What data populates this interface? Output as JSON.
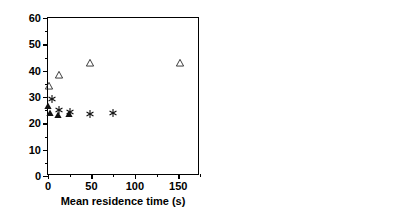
{
  "figure": {
    "ylabel": "CV (based on volume PSD) (%)",
    "width": 410,
    "height": 224,
    "background": "#ffffff",
    "ink_color": "#000000"
  },
  "chart_data": [
    {
      "type": "scatter",
      "panel": "left",
      "title": "",
      "xlabel": "Mean residence time (s)",
      "ylabel": "CV (based on volume PSD) (%)",
      "xlim": [
        0,
        175
      ],
      "ylim": [
        0,
        60
      ],
      "xticks": [
        0,
        50,
        100,
        150
      ],
      "xticklabels": [
        "0",
        "50",
        "100",
        "150"
      ],
      "xminorticks": [
        25,
        75,
        125,
        175
      ],
      "yticks": [
        0,
        10,
        20,
        30,
        40,
        50,
        60
      ],
      "yticklabels": [
        "0",
        "10",
        "20",
        "30",
        "40",
        "50",
        "60"
      ],
      "yminorticks": [
        5,
        15,
        25,
        35,
        45,
        55
      ],
      "grid": false,
      "legend": "none",
      "series": [
        {
          "name": "open-triangle",
          "marker": "open-triangle",
          "points": [
            {
              "x": 1,
              "y": 34.2
            },
            {
              "x": 13,
              "y": 38.4
            },
            {
              "x": 48,
              "y": 43.0
            },
            {
              "x": 152,
              "y": 42.9
            }
          ]
        },
        {
          "name": "asterisk",
          "marker": "asterisk",
          "points": [
            {
              "x": 5,
              "y": 29.4
            },
            {
              "x": 13,
              "y": 25.2
            },
            {
              "x": 25,
              "y": 24.3
            },
            {
              "x": 48,
              "y": 23.6
            },
            {
              "x": 75,
              "y": 24.0
            }
          ]
        },
        {
          "name": "filled-triangle",
          "marker": "filled-triangle",
          "points": [
            {
              "x": 0.5,
              "y": 26.4
            },
            {
              "x": 2,
              "y": 24.1
            },
            {
              "x": 12,
              "y": 23.1
            },
            {
              "x": 24,
              "y": 23.4
            }
          ]
        }
      ]
    },
    {
      "type": "scatter",
      "panel": "right",
      "title": "",
      "xlabel": "Precipitation time (min)",
      "ylabel": "CV (based on volume PSD) (%)",
      "xlim": [
        0,
        150
      ],
      "ylim": [
        0,
        60
      ],
      "xticks": [
        0,
        50,
        100,
        150
      ],
      "xticklabels": [
        "0",
        "50",
        "100",
        "150"
      ],
      "xminorticks": [
        25,
        75,
        125
      ],
      "yticks": [
        0,
        10,
        20,
        30,
        40,
        50,
        60
      ],
      "yticklabels": [
        "0",
        "10",
        "20",
        "30",
        "40",
        "50",
        "60"
      ],
      "yminorticks": [
        5,
        15,
        25,
        35,
        45,
        55
      ],
      "grid": false,
      "legend": "none",
      "series": [
        {
          "name": "plus",
          "marker": "plus",
          "points": [
            {
              "x": 0,
              "y": 24.9
            },
            {
              "x": 10,
              "y": 27.6
            },
            {
              "x": 20,
              "y": 27.6
            },
            {
              "x": 40,
              "y": 30.6
            },
            {
              "x": 90,
              "y": 31.6
            },
            {
              "x": 120,
              "y": 30.1
            }
          ]
        },
        {
          "name": "open-circle",
          "marker": "open-circle",
          "points": [
            {
              "x": 0,
              "y": 24.3
            },
            {
              "x": 10,
              "y": 21.6
            },
            {
              "x": 20,
              "y": 22.0
            },
            {
              "x": 40,
              "y": 25.0
            },
            {
              "x": 90,
              "y": 27.0
            },
            {
              "x": 120,
              "y": 26.0
            }
          ]
        }
      ]
    }
  ]
}
